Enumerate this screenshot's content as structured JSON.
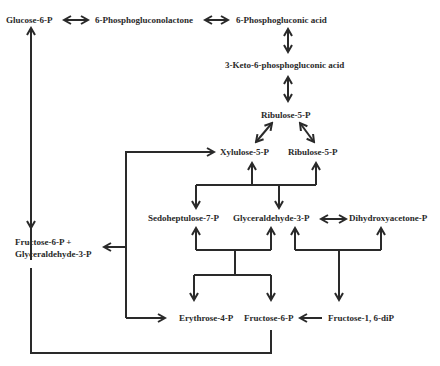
{
  "diagram": {
    "nodes": {
      "glucose6p": "Glucose-6-P",
      "phosphogluconolactone": "6-Phosphogluconolactone",
      "phosphogluconic": "6-Phosphogluconic acid",
      "keto": "3-Keto-6-phosphogluconic acid",
      "ribulose5p_top": "Ribulose-5-P",
      "xylulose5p": "Xylulose-5-P",
      "ribulose5p": "Ribulose-5-P",
      "sedoheptulose7p": "Sedoheptulose-7-P",
      "glyceraldehyde3p": "Glyceraldehyde-3-P",
      "dihydroxyacetonep": "Dihydroxyacetone-P",
      "f6p_g3p_line1": "Fructose-6-P +",
      "f6p_g3p_line2": "Glyceraldehyde-3-P",
      "erythrose4p": "Erythrose-4-P",
      "fructose6p": "Fructose-6-P",
      "fructose16dip": "Fructose-1, 6-diP"
    },
    "colors": {
      "ink": "#2a2a2a",
      "background": "#ffffff"
    }
  }
}
